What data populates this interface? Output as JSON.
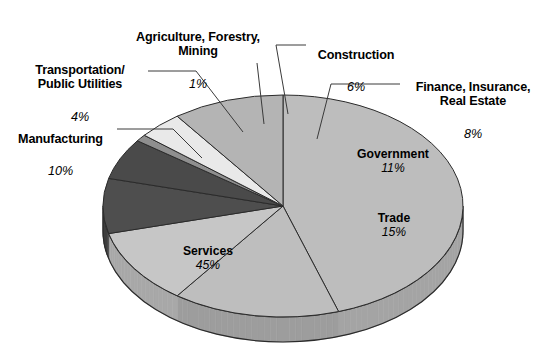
{
  "chart_data": {
    "type": "pie",
    "title": "",
    "subtitle": "",
    "xlabel": "",
    "ylabel": "",
    "legend_position": "none",
    "grid": false,
    "three_d": true,
    "value_unit": "%",
    "categories": [
      "Services",
      "Trade",
      "Government",
      "Manufacturing",
      "Finance, Insurance, Real Estate",
      "Construction",
      "Transportation/Public Utilities",
      "Agriculture, Forestry, Mining"
    ],
    "values": [
      45,
      15,
      11,
      10,
      8,
      6,
      4,
      1
    ],
    "labels": [
      "45%",
      "15%",
      "11%",
      "10%",
      "8%",
      "6%",
      "4%",
      "1%"
    ],
    "slices": [
      {
        "name": "Services",
        "value": 45,
        "label": "45%",
        "color": "#bdbdbd",
        "side_color": "#a4a4a4"
      },
      {
        "name": "Trade",
        "value": 15,
        "label": "15%",
        "color": "#bebebe",
        "side_color": "#9d9d9d"
      },
      {
        "name": "Government",
        "value": 11,
        "label": "11%",
        "color": "#c6c6c6",
        "side_color": "#a8a8a8"
      },
      {
        "name": "Finance, Insurance, Real Estate",
        "value": 8,
        "label": "8%",
        "color": "#4e4e4e",
        "side_color": "#3d3d3d"
      },
      {
        "name": "Construction",
        "value": 6,
        "label": "6%",
        "color": "#4a4a4a",
        "side_color": "#3a3a3a"
      },
      {
        "name": "Agriculture, Forestry, Mining",
        "value": 1,
        "label": "1%",
        "color": "#8f8f8f",
        "side_color": "#7a7a7a"
      },
      {
        "name": "Transportation/Public Utilities",
        "value": 4,
        "label": "4%",
        "color": "#e9e9e9",
        "side_color": "#c9c9c9"
      },
      {
        "name": "Manufacturing",
        "value": 10,
        "label": "10%",
        "color": "#b4b4b4",
        "side_color": "#9a9a9a"
      }
    ]
  },
  "callouts": {
    "agriculture": {
      "name": "Agriculture, Forestry,\nMining",
      "pct": "1%"
    },
    "transportation": {
      "name": "Transportation/\nPublic Utilities",
      "pct": "4%"
    },
    "manufacturing": {
      "name": "Manufacturing",
      "pct": "10%"
    },
    "construction": {
      "name": "Construction",
      "pct": "6%"
    },
    "finance": {
      "name": "Finance, Insurance,\nReal Estate",
      "pct": "8%"
    }
  },
  "inner_labels": {
    "government": {
      "name": "Government",
      "pct": "11%"
    },
    "trade": {
      "name": "Trade",
      "pct": "15%"
    },
    "services": {
      "name": "Services",
      "pct": "45%"
    }
  },
  "colors": {
    "background": "#ffffff",
    "outline": "#2b2b2b",
    "leader_line": "#3a3a3a",
    "text": "#000000"
  }
}
